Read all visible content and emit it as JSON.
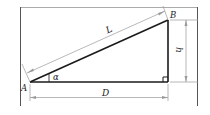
{
  "diagram": {
    "type": "right-triangle-slope",
    "colors": {
      "stroke": "#1a1a1a",
      "dimension": "#9a9a9a",
      "frame": "#555555",
      "frame_top": "#aaaaaa"
    },
    "points": {
      "A": {
        "label": "A",
        "x": 30,
        "y": 82
      },
      "B": {
        "label": "B",
        "x": 168,
        "y": 20
      },
      "C": {
        "x": 168,
        "y": 82
      }
    },
    "labels": {
      "A": "A",
      "B": "B",
      "L": "L",
      "h": "h",
      "D": "D",
      "alpha": "α"
    },
    "dimensions": [
      {
        "name": "L",
        "meaning": "hypotenuse length"
      },
      {
        "name": "h",
        "meaning": "vertical height"
      },
      {
        "name": "D",
        "meaning": "horizontal distance"
      }
    ],
    "angle": {
      "name": "α",
      "at": "A"
    },
    "right_angle_at": "C"
  }
}
